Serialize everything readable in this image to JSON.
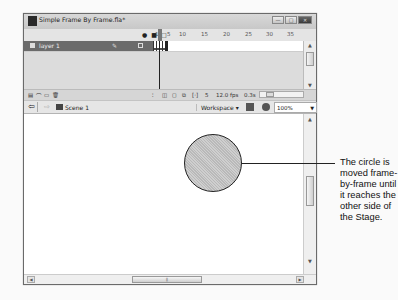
{
  "window": {
    "title": "Simple Frame By Frame.fla*",
    "controls": {
      "minimize": "—",
      "maximize": "□",
      "close": "✕"
    }
  },
  "timeline": {
    "header_icons": [
      "eye-icon",
      "lock-icon",
      "outline-icon"
    ],
    "ruler_ticks": [
      "1",
      "5",
      "10",
      "15",
      "20",
      "25",
      "30",
      "35"
    ],
    "layers": [
      {
        "name": "layer 1",
        "selected": true
      }
    ],
    "keyframes": 5,
    "footer": {
      "current_frame": "5",
      "frame_rate": "12.0 fps",
      "elapsed_time": "0.3s"
    }
  },
  "edit_bar": {
    "scene_label": "Scene 1",
    "workspace_label": "Workspace ▾",
    "zoom_value": "100%"
  },
  "stage": {
    "shape": "circle",
    "fill": "hatched gray"
  },
  "callout": {
    "text": "The circle is moved frame-by-frame until it reaches the other side of the Stage."
  }
}
